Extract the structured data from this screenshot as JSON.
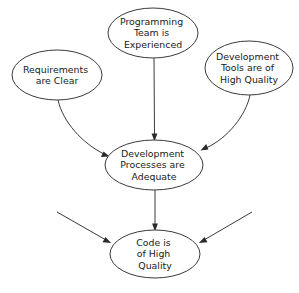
{
  "diagram": {
    "background_color": "#ffffff",
    "stroke_color": "#3a3a3a",
    "text_color": "#1a1a1a",
    "nodes": [
      {
        "id": "programming-team",
        "label": "Programming Team is Experienced",
        "lines": [
          "Programming",
          "Team is",
          "Experienced"
        ],
        "shape": "ellipse",
        "cx": 153,
        "cy": 33,
        "rx": 45,
        "ry": 25
      },
      {
        "id": "requirements-clear",
        "label": "Requirements are Clear",
        "lines": [
          "Requirements",
          "are Clear"
        ],
        "shape": "ellipse",
        "cx": 57,
        "cy": 75,
        "rx": 45,
        "ry": 25
      },
      {
        "id": "development-tools",
        "label": "Development Tools are of High Quality",
        "lines": [
          "Development",
          "Tools are of",
          "High Quality"
        ],
        "shape": "ellipse",
        "cx": 249,
        "cy": 68,
        "rx": 44,
        "ry": 27
      },
      {
        "id": "development-processes",
        "label": "Development Processes are Adequate",
        "lines": [
          "Development",
          "Processes are",
          "Adequate"
        ],
        "shape": "ellipse",
        "cx": 154,
        "cy": 165,
        "rx": 49,
        "ry": 25
      },
      {
        "id": "code-quality",
        "label": "Code is of High Quality",
        "lines": [
          "Code is",
          "of High",
          "Quality"
        ],
        "shape": "ellipse",
        "cx": 155,
        "cy": 254,
        "rx": 45,
        "ry": 24
      }
    ],
    "edges": [
      {
        "id": "edge-team-to-processes",
        "from": "programming-team",
        "to": "development-processes",
        "style": "straight-vertical"
      },
      {
        "id": "edge-requirements-to-processes",
        "from": "requirements-clear",
        "to": "development-processes",
        "style": "curved"
      },
      {
        "id": "edge-tools-to-processes",
        "from": "development-tools",
        "to": "development-processes",
        "style": "curved"
      },
      {
        "id": "edge-processes-to-code",
        "from": "development-processes",
        "to": "code-quality",
        "style": "straight-vertical"
      },
      {
        "id": "edge-external-left-to-code",
        "from": "external-left",
        "to": "code-quality",
        "style": "straight-diagonal"
      },
      {
        "id": "edge-external-right-to-code",
        "from": "external-right",
        "to": "code-quality",
        "style": "straight-diagonal"
      }
    ]
  }
}
